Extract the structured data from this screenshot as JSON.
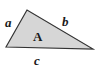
{
  "diagram": {
    "type": "triangle",
    "fill_color": "#d6d6d6",
    "stroke_color": "#333333",
    "vertices": {
      "left": [
        6,
        47
      ],
      "top": [
        27,
        10
      ],
      "right": [
        93,
        49
      ]
    },
    "labels": {
      "side_a": "a",
      "side_b": "b",
      "side_c": "c",
      "area": "A"
    }
  }
}
